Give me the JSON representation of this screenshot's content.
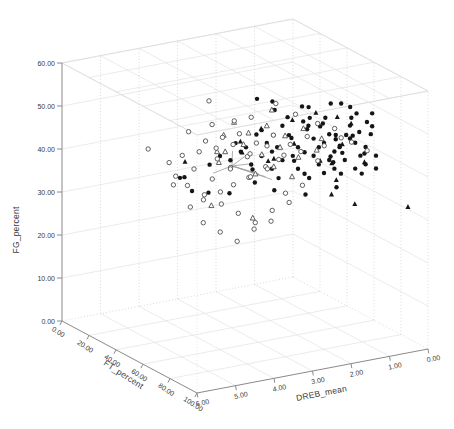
{
  "figure": {
    "background": "#ffffff",
    "width": 454,
    "height": 429
  },
  "chart_data": {
    "type": "scatter",
    "subtype": "3d-scatter",
    "title": "",
    "grid": true,
    "legend": "none",
    "axes": {
      "z": {
        "label": "FG_percent",
        "range": [
          0,
          60
        ],
        "tick_values": [
          0,
          10,
          20,
          30,
          40,
          50,
          60
        ],
        "ticks": [
          "0.00",
          "10.00",
          "20.00",
          "30.00",
          "40.00",
          "50.00",
          "60.00"
        ]
      },
      "x": {
        "label": "FT_percent",
        "range": [
          0,
          100
        ],
        "tick_values": [
          0,
          20,
          40,
          60,
          80,
          100
        ],
        "ticks": [
          "0.00",
          "20.00",
          "40.00",
          "60.00",
          "80.00",
          "100.00"
        ]
      },
      "y": {
        "label": "DREB_mean",
        "range": [
          6,
          0
        ],
        "tick_values": [
          6,
          5,
          4,
          3,
          2,
          1,
          0
        ],
        "ticks": [
          "6.00",
          "5.00",
          "4.00",
          "3.00",
          "2.00",
          "1.00",
          "0.00"
        ]
      }
    },
    "colors": {
      "marker_filled": "#151515",
      "marker_open_stroke": "#4f4f4f",
      "marker_open_fill": "#ffffff",
      "grid_solid": "#e3e3e3",
      "grid_dotted": "#c9c9c9",
      "box_edge": "#d8d8d8",
      "axis_line": "#8a8a8a",
      "tick_text": "#3a3a3a",
      "connector": "#9a9a9a"
    },
    "points": {
      "filled_circle": [
        [
          72,
          2.8,
          44
        ],
        [
          75,
          2.5,
          47
        ],
        [
          78,
          2.2,
          45
        ],
        [
          80,
          2,
          48
        ],
        [
          82,
          1.8,
          46
        ],
        [
          85,
          1.5,
          49
        ],
        [
          88,
          1.2,
          47
        ],
        [
          90,
          1,
          45
        ],
        [
          70,
          3,
          46
        ],
        [
          73,
          2.6,
          49
        ],
        [
          76,
          2.3,
          51
        ],
        [
          79,
          2.1,
          43
        ],
        [
          81,
          1.9,
          50
        ],
        [
          84,
          1.6,
          44
        ],
        [
          86,
          1.4,
          48
        ],
        [
          89,
          1.1,
          50
        ],
        [
          85,
          1.7,
          46
        ],
        [
          86,
          1.8,
          48
        ],
        [
          68,
          3.2,
          45
        ],
        [
          71,
          2.9,
          47
        ],
        [
          74,
          2.7,
          50
        ],
        [
          77,
          2.4,
          46
        ],
        [
          80,
          2.1,
          52
        ],
        [
          83,
          1.7,
          47
        ],
        [
          87,
          1.3,
          45
        ],
        [
          83,
          1.8,
          49
        ],
        [
          66,
          3.4,
          43
        ],
        [
          69,
          3.1,
          48
        ],
        [
          72,
          2.8,
          52
        ],
        [
          75,
          2.5,
          42
        ],
        [
          78,
          2.2,
          49
        ],
        [
          81,
          1.9,
          44
        ],
        [
          85,
          1.5,
          52
        ],
        [
          88,
          1.2,
          43
        ],
        [
          90,
          1.1,
          52
        ],
        [
          84,
          1.9,
          44
        ],
        [
          64,
          3.6,
          46
        ],
        [
          67,
          3.3,
          50
        ],
        [
          70,
          3,
          42
        ],
        [
          74,
          2.6,
          45
        ],
        [
          77,
          2.3,
          52
        ],
        [
          80,
          2,
          41
        ],
        [
          83,
          1.8,
          50
        ],
        [
          86,
          1.4,
          42
        ],
        [
          89,
          1.2,
          53
        ],
        [
          89,
          1.4,
          51
        ],
        [
          62,
          3.8,
          44
        ],
        [
          65,
          3.5,
          47
        ],
        [
          68,
          3.2,
          51
        ],
        [
          72,
          2.9,
          40
        ],
        [
          76,
          2.4,
          53
        ],
        [
          79,
          2.1,
          47
        ],
        [
          82,
          1.8,
          42
        ],
        [
          86,
          1.5,
          54
        ],
        [
          90,
          1,
          42
        ],
        [
          87,
          1.5,
          50
        ],
        [
          60,
          4,
          45
        ],
        [
          63,
          3.7,
          48
        ],
        [
          67,
          3.4,
          42
        ],
        [
          71,
          3,
          50
        ],
        [
          75,
          2.6,
          44
        ],
        [
          78,
          2.3,
          54
        ],
        [
          82,
          1.9,
          45
        ],
        [
          85,
          1.6,
          50
        ],
        [
          88,
          1.3,
          41
        ],
        [
          82,
          2.1,
          53
        ],
        [
          90,
          1.3,
          46
        ],
        [
          58,
          4.2,
          43
        ],
        [
          73,
          2.7,
          54
        ],
        [
          77,
          2.4,
          41
        ],
        [
          81,
          2,
          54
        ],
        [
          84,
          1.7,
          41
        ],
        [
          87,
          1.4,
          55
        ],
        [
          90,
          1.1,
          55
        ],
        [
          87,
          1.8,
          58
        ],
        [
          85,
          2,
          58
        ],
        [
          78,
          2.5,
          57
        ],
        [
          72,
          3,
          56
        ],
        [
          88,
          1.6,
          57
        ],
        [
          80,
          2.4,
          57
        ],
        [
          69,
          2,
          38
        ],
        [
          75,
          1.5,
          36
        ],
        [
          72,
          2.2,
          35
        ],
        [
          66,
          2.8,
          36
        ],
        [
          63,
          3.2,
          38
        ],
        [
          44.6,
          4.5,
          38.2
        ],
        [
          46.5,
          4.45,
          38.6
        ],
        [
          56.4,
          4.6,
          37.3
        ],
        [
          60,
          4.3,
          37
        ],
        [
          67,
          4,
          37.5
        ],
        [
          70.3,
          3.4,
          59
        ],
        [
          76,
          3.2,
          59
        ]
      ],
      "open_circle": [
        [
          50,
          4.8,
          40
        ],
        [
          55,
          4.5,
          42
        ],
        [
          60,
          4.2,
          40
        ],
        [
          65,
          3.9,
          43
        ],
        [
          70,
          3.6,
          41
        ],
        [
          58,
          4,
          44
        ],
        [
          62,
          3.8,
          42
        ],
        [
          66,
          3.5,
          45
        ],
        [
          71,
          3.2,
          43
        ],
        [
          75,
          3,
          45
        ],
        [
          53,
          4.6,
          38
        ],
        [
          57,
          4.3,
          36
        ],
        [
          61,
          4,
          34
        ],
        [
          65,
          3.7,
          32
        ],
        [
          69,
          3.4,
          30
        ],
        [
          73,
          3.1,
          33
        ],
        [
          77,
          2.8,
          35
        ],
        [
          59,
          4.4,
          30
        ],
        [
          63,
          4.1,
          28
        ],
        [
          67,
          3.8,
          26
        ],
        [
          71,
          3.5,
          29
        ],
        [
          75,
          3.2,
          31
        ],
        [
          41,
          5.2,
          45.5
        ],
        [
          48,
          4.9,
          43
        ],
        [
          52,
          4.7,
          45
        ],
        [
          56,
          4.4,
          46
        ],
        [
          60,
          4.1,
          47
        ],
        [
          64,
          3.8,
          48
        ],
        [
          68,
          3.5,
          46
        ],
        [
          72,
          3.2,
          48
        ],
        [
          76,
          2.9,
          46
        ],
        [
          80,
          2.6,
          47
        ],
        [
          84,
          2.3,
          45
        ],
        [
          55,
          4.2,
          48
        ],
        [
          59,
          3.9,
          49
        ],
        [
          63,
          3.6,
          50
        ],
        [
          67,
          3.3,
          48
        ],
        [
          71,
          3,
          50
        ],
        [
          75,
          2.7,
          48
        ],
        [
          79,
          2.4,
          50
        ],
        [
          83,
          2.1,
          48
        ],
        [
          87,
          1.8,
          50
        ],
        [
          51,
          4.5,
          50
        ],
        [
          57,
          4.1,
          52
        ],
        [
          62,
          3.7,
          53
        ],
        [
          66,
          3.4,
          54
        ],
        [
          60.4,
          4.3,
          58.4
        ],
        [
          70,
          2.9,
          57
        ],
        [
          76,
          2.6,
          55
        ],
        [
          81,
          2.2,
          53
        ],
        [
          85,
          1.9,
          52
        ],
        [
          89,
          1.6,
          49
        ],
        [
          92,
          1.3,
          47
        ],
        [
          78,
          3.4,
          44
        ],
        [
          74,
          3.7,
          42
        ],
        [
          70,
          4,
          40
        ],
        [
          66,
          4.2,
          38
        ],
        [
          62,
          4.5,
          36
        ],
        [
          58,
          4.7,
          34
        ],
        [
          54,
          5,
          39
        ],
        [
          80,
          3,
          38
        ],
        [
          84,
          2.7,
          40
        ]
      ],
      "filled_triangle": [
        [
          93.7,
          0.3,
          32.5
        ],
        [
          80,
          1.2,
          32.4
        ],
        [
          71.5,
          1.5,
          41
        ],
        [
          72,
          1.4,
          37
        ],
        [
          56.9,
          4.8,
          44.5
        ],
        [
          65,
          3.6,
          46
        ],
        [
          70,
          3.1,
          44
        ],
        [
          75,
          2.6,
          48
        ],
        [
          80,
          2.1,
          44
        ],
        [
          85,
          1.7,
          48
        ],
        [
          90,
          1.3,
          44
        ],
        [
          68,
          2.4,
          52
        ],
        [
          74,
          2,
          54
        ],
        [
          62,
          3,
          50
        ],
        [
          58,
          3.4,
          47
        ],
        [
          83,
          1.4,
          52
        ],
        [
          87,
          1.9,
          55
        ],
        [
          77,
          1.7,
          35
        ],
        [
          60,
          2.6,
          42
        ]
      ],
      "open_triangle": [
        [
          61,
          3.9,
          46
        ],
        [
          66,
          3.6,
          48
        ],
        [
          71,
          3.3,
          46
        ],
        [
          76,
          3,
          48
        ],
        [
          81,
          2.7,
          46
        ],
        [
          86,
          2.4,
          48
        ],
        [
          64,
          3.4,
          50
        ],
        [
          69,
          3.1,
          52
        ],
        [
          74,
          2.8,
          50
        ],
        [
          79,
          2.5,
          52
        ],
        [
          84,
          2.2,
          50
        ],
        [
          67,
          2.9,
          55
        ],
        [
          57,
          3.8,
          49
        ],
        [
          62,
          4.1,
          44
        ],
        [
          72,
          3.5,
          42
        ],
        [
          77,
          3.2,
          44
        ],
        [
          82,
          2.9,
          42
        ],
        [
          59,
          3.6,
          52
        ],
        [
          65,
          4.4,
          35
        ],
        [
          70,
          3.5,
          31.4
        ],
        [
          55,
          3.9,
          45
        ]
      ]
    },
    "connector_lines": [
      [
        [
          57.5,
          3.6,
          41.6
        ],
        [
          66,
          3.2,
          40.5
        ]
      ],
      [
        [
          57.5,
          3.6,
          41.6
        ],
        [
          68,
          3.1,
          40
        ]
      ],
      [
        [
          57.5,
          3.6,
          41.6
        ],
        [
          70,
          3,
          39.5
        ]
      ],
      [
        [
          57.5,
          3.6,
          41.6
        ],
        [
          63,
          3.3,
          42.5
        ]
      ],
      [
        [
          57.5,
          3.6,
          41.6
        ],
        [
          52,
          3.9,
          39.5
        ]
      ],
      [
        [
          57.5,
          3.6,
          41.6
        ],
        [
          55,
          3.5,
          44.5
        ]
      ],
      [
        [
          57.5,
          3.6,
          41.6
        ],
        [
          61,
          3.4,
          44
        ]
      ]
    ]
  }
}
